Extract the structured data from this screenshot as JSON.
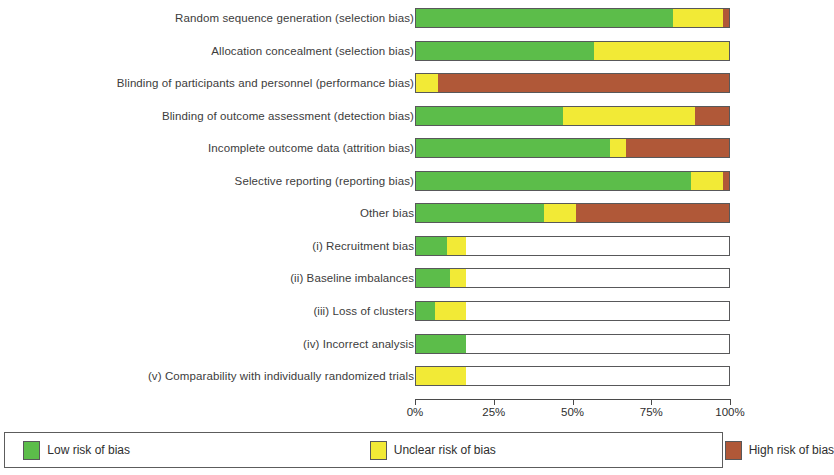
{
  "chart_data": {
    "type": "bar",
    "subtype": "stacked-horizontal-percent",
    "title": "",
    "xlabel": "",
    "ylabel": "",
    "xlim": [
      0,
      100
    ],
    "grid": false,
    "legend_position": "bottom",
    "tick_labels": [
      "0%",
      "25%",
      "50%",
      "75%",
      "100%"
    ],
    "tick_values": [
      0,
      25,
      50,
      75,
      100
    ],
    "series": [
      {
        "name": "Low risk of bias",
        "color": "#5cbd4a"
      },
      {
        "name": "Unclear risk of bias",
        "color": "#f2ea36"
      },
      {
        "name": "High risk of bias",
        "color": "#b05838"
      }
    ],
    "categories": [
      "Random sequence generation (selection bias)",
      "Allocation concealment (selection bias)",
      "Blinding of participants and personnel (performance bias)",
      "Blinding of outcome assessment (detection bias)",
      "Incomplete outcome data (attrition bias)",
      "Selective reporting (reporting bias)",
      "Other bias",
      "(i) Recruitment bias",
      "(ii) Baseline imbalances",
      "(iii) Loss of clusters",
      "(iv) Incorrect analysis",
      "(v) Comparability with individually randomized trials"
    ],
    "rows": [
      {
        "category": "Random sequence generation (selection bias)",
        "low": 82,
        "unclear": 16,
        "high": 2
      },
      {
        "category": "Allocation concealment (selection bias)",
        "low": 57,
        "unclear": 43,
        "high": 0
      },
      {
        "category": "Blinding of participants and personnel (performance bias)",
        "low": 0,
        "unclear": 7,
        "high": 93
      },
      {
        "category": "Blinding of outcome assessment (detection bias)",
        "low": 47,
        "unclear": 42,
        "high": 11
      },
      {
        "category": "Incomplete outcome data (attrition bias)",
        "low": 62,
        "unclear": 5,
        "high": 33
      },
      {
        "category": "Selective reporting (reporting bias)",
        "low": 88,
        "unclear": 10,
        "high": 2
      },
      {
        "category": "Other bias",
        "low": 41,
        "unclear": 10,
        "high": 49
      },
      {
        "category": "(i) Recruitment bias",
        "low": 10,
        "unclear": 6,
        "high": 0
      },
      {
        "category": "(ii) Baseline imbalances",
        "low": 11,
        "unclear": 5,
        "high": 0
      },
      {
        "category": "(iii) Loss of clusters",
        "low": 6,
        "unclear": 10,
        "high": 0
      },
      {
        "category": "(iv) Incorrect analysis",
        "low": 16,
        "unclear": 0,
        "high": 0
      },
      {
        "category": "(v) Comparability with individually randomized trials",
        "low": 0,
        "unclear": 16,
        "high": 0
      }
    ]
  },
  "legend": {
    "items": [
      {
        "label": "Low risk of bias",
        "color": "#5cbd4a"
      },
      {
        "label": "Unclear risk of bias",
        "color": "#f2ea36"
      },
      {
        "label": "High risk of bias",
        "color": "#b05838"
      }
    ]
  }
}
